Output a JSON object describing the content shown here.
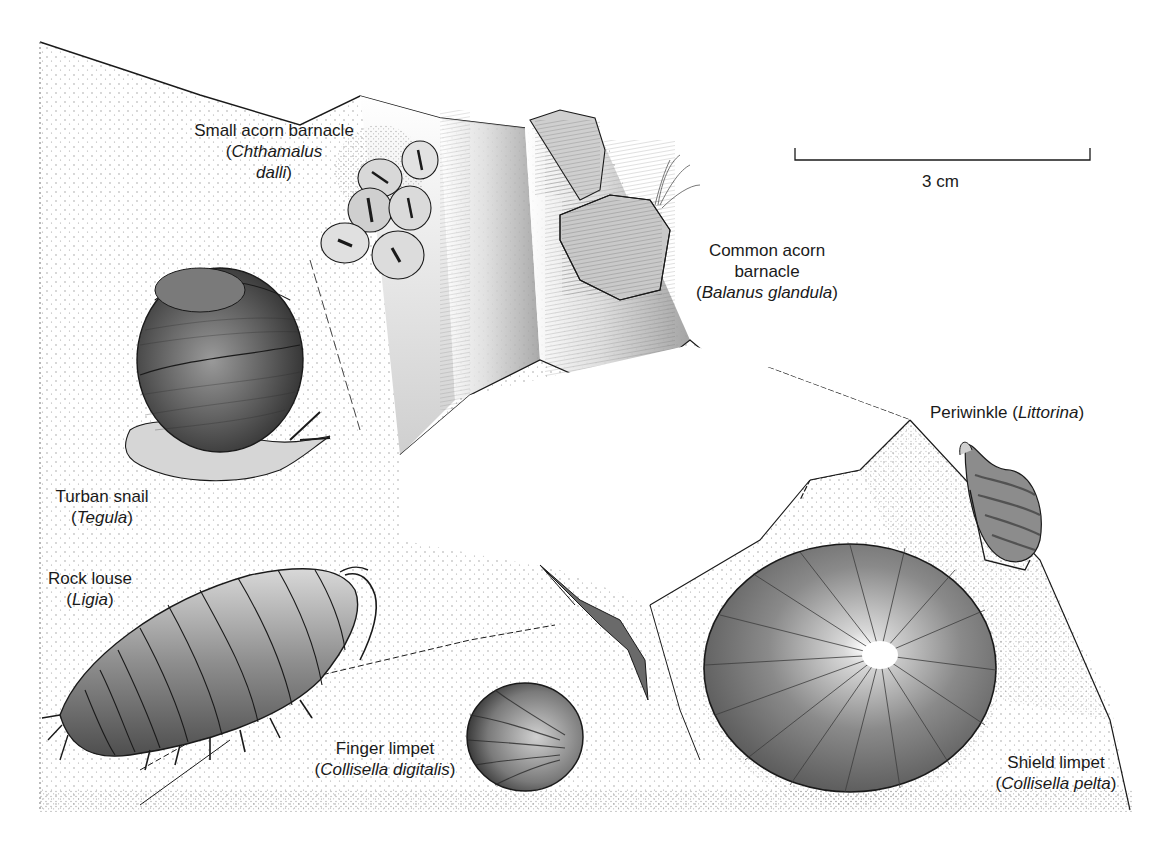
{
  "figure": {
    "scale_bar": {
      "label": "3 cm"
    },
    "organisms": [
      {
        "id": "small-acorn-barnacle",
        "common": "Small acorn barnacle",
        "paren_open": "(",
        "scientific": "Chthamalus",
        "scientific_2": "dalli",
        "paren_close": ")"
      },
      {
        "id": "common-acorn-barnacle",
        "common": "Common acorn",
        "common_2": "barnacle",
        "paren_open": "(",
        "scientific": "Balanus glandula",
        "paren_close": ")"
      },
      {
        "id": "periwinkle",
        "common": "Periwinkle",
        "paren_open": "(",
        "scientific": "Littorina",
        "paren_close": ")"
      },
      {
        "id": "turban-snail",
        "common": "Turban snail",
        "paren_open": "(",
        "scientific": "Tegula",
        "paren_close": ")"
      },
      {
        "id": "rock-louse",
        "common": "Rock louse",
        "paren_open": "(",
        "scientific": "Ligia",
        "paren_close": ")"
      },
      {
        "id": "finger-limpet",
        "common": "Finger limpet",
        "paren_open": "(",
        "scientific": "Collisella digitalis",
        "paren_close": ")"
      },
      {
        "id": "shield-limpet",
        "common": "Shield limpet",
        "paren_open": "(",
        "scientific": "Collisella pelta",
        "paren_close": ")"
      }
    ]
  },
  "colors": {
    "ink": "#1a1a1a",
    "shell_dark": "#4a4a4a",
    "shell_mid": "#8a8a8a",
    "shell_light": "#c8c8c8",
    "stipple": "#9a9a9a",
    "background": "#ffffff"
  }
}
